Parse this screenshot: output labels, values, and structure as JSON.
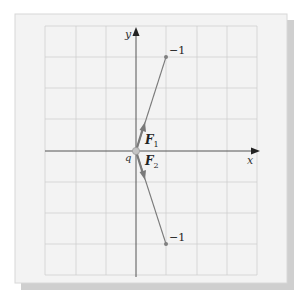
{
  "diagram": {
    "axes": {
      "x_label": "x",
      "y_label": "y"
    },
    "origin_charge": {
      "label": "q"
    },
    "charges": [
      {
        "label": "−1",
        "position": "upper-right"
      },
      {
        "label": "−1",
        "position": "lower-right"
      }
    ],
    "forces": [
      {
        "label": "F",
        "subscript": "1"
      },
      {
        "label": "F",
        "subscript": "2"
      }
    ],
    "colors": {
      "frame_bg": "#f3f3f3",
      "grid": "#cfcfcf",
      "axis": "#555555",
      "vector": "#7a7a7a",
      "charge_dot": "#808080",
      "shadow": "#9a9a9a"
    }
  }
}
